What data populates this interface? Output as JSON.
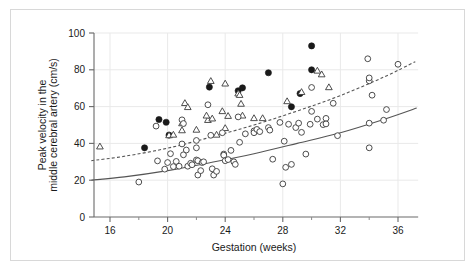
{
  "chart_data": {
    "type": "scatter",
    "title": "",
    "xlabel": "Gestation (weeks)",
    "ylabel": "Peak velocity in the middle cerebral artery (cm/s)",
    "ylabel_line1": "Peak velocity in the",
    "ylabel_line2": "middle cerebral artery (cm/s)",
    "xlim": [
      14.6,
      37.4
    ],
    "ylim": [
      0,
      100
    ],
    "xticks": [
      16,
      20,
      24,
      28,
      32,
      36
    ],
    "xtick_labels": [
      "16",
      "20",
      "24",
      "28",
      "32",
      "36"
    ],
    "xminorticks": [
      18,
      22,
      26,
      30,
      34
    ],
    "yticks": [
      0,
      20,
      40,
      60,
      80,
      100
    ],
    "ytick_labels": [
      "0",
      "20",
      "40",
      "60",
      "80",
      "100"
    ],
    "grid": "light vertical gridlines at major x ticks and horizontal gridlines at major y ticks",
    "legend": "none",
    "series": [
      {
        "name": "filled-circles",
        "marker": "filled-circle",
        "color": "#1a1a1a",
        "points": [
          [
            18.4,
            37.6
          ],
          [
            19.4,
            53.0
          ],
          [
            19.9,
            51.5
          ],
          [
            20.1,
            44.5
          ],
          [
            22.9,
            70.6
          ],
          [
            24.9,
            68.6
          ],
          [
            25.2,
            70.2
          ],
          [
            27.0,
            78.4
          ],
          [
            28.6,
            59.9
          ],
          [
            29.2,
            67.1
          ],
          [
            30.0,
            93.0
          ],
          [
            30.0,
            80.0
          ]
        ]
      },
      {
        "name": "open-triangles",
        "marker": "open-triangle",
        "color": "#3a3a3a",
        "points": [
          [
            15.3,
            38.2
          ],
          [
            20.1,
            44.3
          ],
          [
            20.4,
            44.6
          ],
          [
            21.0,
            50.8
          ],
          [
            21.0,
            47.0
          ],
          [
            21.2,
            61.8
          ],
          [
            21.4,
            59.6
          ],
          [
            22.0,
            47.3
          ],
          [
            22.8,
            52.6
          ],
          [
            22.7,
            55.0
          ],
          [
            23.0,
            73.8
          ],
          [
            23.1,
            53.4
          ],
          [
            23.4,
            44.6
          ],
          [
            23.8,
            57.4
          ],
          [
            24.0,
            72.4
          ],
          [
            24.0,
            48.2
          ],
          [
            24.2,
            54.8
          ],
          [
            24.9,
            67.0
          ],
          [
            25.0,
            66.2
          ],
          [
            25.1,
            61.4
          ],
          [
            25.2,
            55.0
          ],
          [
            26.0,
            53.6
          ],
          [
            26.6,
            53.6
          ],
          [
            28.3,
            62.8
          ],
          [
            29.3,
            67.8
          ],
          [
            30.4,
            79.4
          ],
          [
            30.7,
            77.4
          ],
          [
            31.2,
            70.4
          ]
        ]
      },
      {
        "name": "open-circles",
        "marker": "open-circle",
        "color": "#3a3a3a",
        "points": [
          [
            18.0,
            19.0
          ],
          [
            19.2,
            49.4
          ],
          [
            19.3,
            30.5
          ],
          [
            19.8,
            26.0
          ],
          [
            20.0,
            29.6
          ],
          [
            20.2,
            34.4
          ],
          [
            20.4,
            27.4
          ],
          [
            20.6,
            30.2
          ],
          [
            20.8,
            27.6
          ],
          [
            21.0,
            39.7
          ],
          [
            21.0,
            52.8
          ],
          [
            21.1,
            50.8
          ],
          [
            21.1,
            33.8
          ],
          [
            21.3,
            36.4
          ],
          [
            21.4,
            27.6
          ],
          [
            21.6,
            29.2
          ],
          [
            21.7,
            28.4
          ],
          [
            22.0,
            41.6
          ],
          [
            22.0,
            31.0
          ],
          [
            22.0,
            37.6
          ],
          [
            22.1,
            30.6
          ],
          [
            22.1,
            22.8
          ],
          [
            22.3,
            25.2
          ],
          [
            22.4,
            29.6
          ],
          [
            22.5,
            30.0
          ],
          [
            22.8,
            61.0
          ],
          [
            23.0,
            44.4
          ],
          [
            23.1,
            26.2
          ],
          [
            23.2,
            22.8
          ],
          [
            23.4,
            24.8
          ],
          [
            23.8,
            45.8
          ],
          [
            23.9,
            34.2
          ],
          [
            23.9,
            33.6
          ],
          [
            24.0,
            30.6
          ],
          [
            24.2,
            31.2
          ],
          [
            24.4,
            36.2
          ],
          [
            24.6,
            30.0
          ],
          [
            24.7,
            28.6
          ],
          [
            24.9,
            54.4
          ],
          [
            25.0,
            40.6
          ],
          [
            25.4,
            45.2
          ],
          [
            26.0,
            46.8
          ],
          [
            26.0,
            45.8
          ],
          [
            26.2,
            47.6
          ],
          [
            26.4,
            46.4
          ],
          [
            27.0,
            48.6
          ],
          [
            27.1,
            47.2
          ],
          [
            27.3,
            31.4
          ],
          [
            27.8,
            51.4
          ],
          [
            28.0,
            18.0
          ],
          [
            28.1,
            41.2
          ],
          [
            28.2,
            27.0
          ],
          [
            28.4,
            50.4
          ],
          [
            28.6,
            28.6
          ],
          [
            28.9,
            48.6
          ],
          [
            29.1,
            51.0
          ],
          [
            29.3,
            46.0
          ],
          [
            29.6,
            34.2
          ],
          [
            29.9,
            50.4
          ],
          [
            30.0,
            57.4
          ],
          [
            30.0,
            70.4
          ],
          [
            30.4,
            53.2
          ],
          [
            30.8,
            50.2
          ],
          [
            31.0,
            53.6
          ],
          [
            31.0,
            50.6
          ],
          [
            31.5,
            61.8
          ],
          [
            31.8,
            44.2
          ],
          [
            33.9,
            86.0
          ],
          [
            34.0,
            74.0
          ],
          [
            34.0,
            75.6
          ],
          [
            34.0,
            51.0
          ],
          [
            34.0,
            37.6
          ],
          [
            34.2,
            66.2
          ],
          [
            35.0,
            52.6
          ],
          [
            35.2,
            58.4
          ],
          [
            36.0,
            83.0
          ]
        ]
      }
    ],
    "reference_curves": [
      {
        "name": "upper-reference-dashed",
        "style": "dashed",
        "color": "#555555",
        "points": [
          [
            14.7,
            30.6
          ],
          [
            17.0,
            33.0
          ],
          [
            20.0,
            37.4
          ],
          [
            23.0,
            43.4
          ],
          [
            26.0,
            50.0
          ],
          [
            29.0,
            57.6
          ],
          [
            32.0,
            66.0
          ],
          [
            35.0,
            76.0
          ],
          [
            37.2,
            84.4
          ]
        ]
      },
      {
        "name": "lower-reference-solid",
        "style": "solid",
        "color": "#555555",
        "points": [
          [
            14.7,
            20.0
          ],
          [
            17.0,
            21.8
          ],
          [
            20.0,
            25.2
          ],
          [
            23.0,
            29.6
          ],
          [
            26.0,
            34.4
          ],
          [
            29.0,
            40.0
          ],
          [
            32.0,
            45.8
          ],
          [
            35.0,
            53.0
          ],
          [
            37.3,
            59.2
          ]
        ]
      }
    ]
  }
}
